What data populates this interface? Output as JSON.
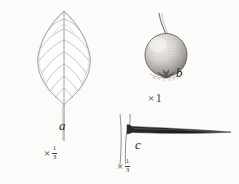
{
  "plate": {
    "background_color": "#fbfbfa",
    "ink_color": "#4a4a4a",
    "figures": [
      {
        "key": "a",
        "label": "a",
        "subject": "leaf",
        "description": "ovate-elliptic leaf with acute apex, pinnate venation and slender petiole",
        "scale": {
          "times": "×",
          "numerator": "1",
          "denominator": "3"
        }
      },
      {
        "key": "b",
        "label": "b",
        "subject": "fruit",
        "description": "globose stippled fruit with persistent calyx and slender pedicel",
        "scale": {
          "times": "×",
          "whole": "1"
        }
      },
      {
        "key": "c",
        "label": "c",
        "subject": "thorn",
        "description": "long tapering thorn on a twig with flared base",
        "scale": {
          "times": "×",
          "numerator": "1",
          "denominator": "3"
        }
      }
    ]
  }
}
